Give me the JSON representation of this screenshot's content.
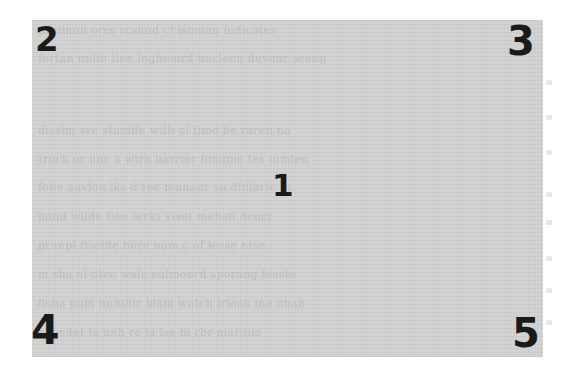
{
  "figure": {
    "type": "annotated-document-region",
    "background_color": "#ffffff",
    "panel": {
      "fill_color": "#d0d0d0",
      "text_color": "#b9b9b9",
      "description": "gray overlay covering scanned document text (illegible)"
    },
    "labels": [
      {
        "id": "1",
        "text": "1",
        "position": "center"
      },
      {
        "id": "2",
        "text": "2",
        "position": "top-left"
      },
      {
        "id": "3",
        "text": "3",
        "position": "top-right"
      },
      {
        "id": "4",
        "text": "4",
        "position": "bottom-left"
      },
      {
        "id": "5",
        "text": "5",
        "position": "bottom-right"
      }
    ],
    "label_color": "#1a1a1a"
  },
  "faded_text_lines": [
    "prelimin orcs rcsand cf isoman fedicotes",
    "fortan nnlih tiee lnghomrd nucleon duvonr seeng",
    "",
    "dissim sve stanide with ol fimo be raren na",
    "Iruck or unc a wirh barrier fomime tes lumlen",
    "fohe auvlon lks d rec munaur su dlnlarie In",
    "nand wilde flee ferks viset mehen deuci",
    "pranpl fiselde bore num c of lesse nise",
    "m sha ol dtco wale eulmoord sporang leeste",
    "lisha pum nunihir blam watch irleak ine nnan",
    "nrundet la nnh re la lse m rbr marinio"
  ]
}
